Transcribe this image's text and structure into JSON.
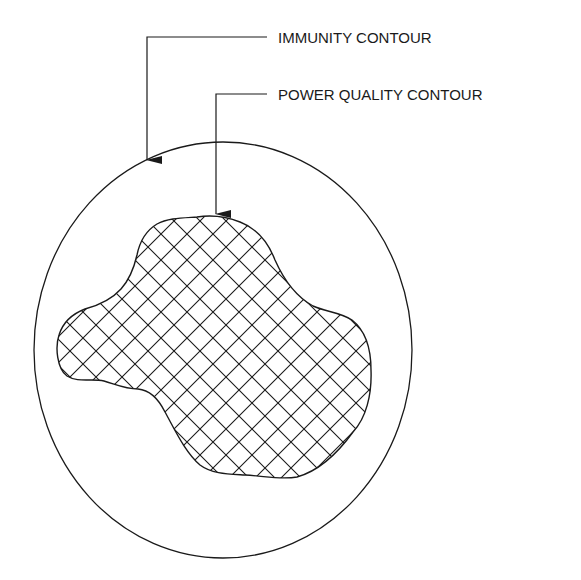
{
  "diagram": {
    "type": "contour-diagram",
    "labels": {
      "immunity": "IMMUNITY CONTOUR",
      "power_quality": "POWER QUALITY CONTOUR"
    },
    "colors": {
      "stroke": "#1a1a1a",
      "background": "#ffffff"
    },
    "shapes": {
      "immunity_contour": "circle",
      "power_quality_contour": "irregular cross-hatched region inside circle"
    }
  }
}
